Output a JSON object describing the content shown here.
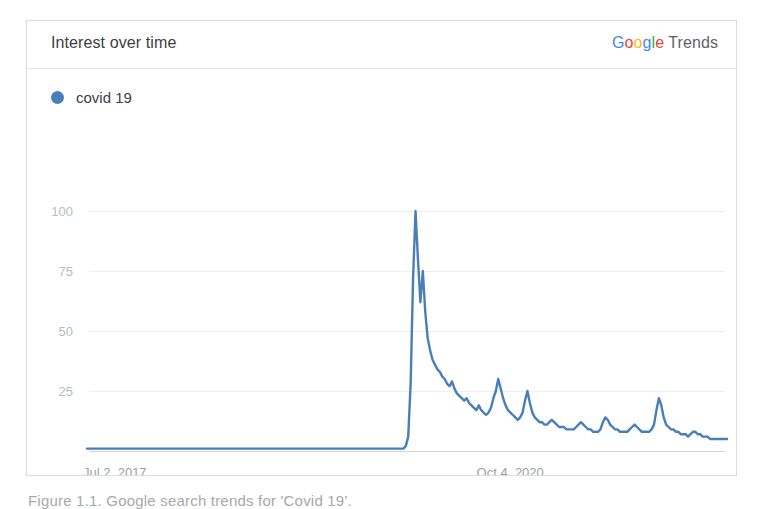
{
  "card": {
    "title": "Interest over time",
    "brand": {
      "google_letters": [
        "G",
        "o",
        "o",
        "g",
        "l",
        "e"
      ],
      "google_colors": [
        "#4285F4",
        "#EA4335",
        "#FBBC05",
        "#4285F4",
        "#34A853",
        "#EA4335"
      ],
      "suffix": "Trends"
    }
  },
  "legend": {
    "items": [
      {
        "label": "covid 19",
        "color": "#4a7ebb"
      }
    ]
  },
  "caption": {
    "text": "Figure 1.1.  Google search trends for 'Covid 19'."
  },
  "chart_data": {
    "type": "line",
    "title": "Interest over time",
    "xlabel": "",
    "ylabel": "",
    "ylim": [
      0,
      100
    ],
    "yticks": [
      25,
      50,
      75,
      100
    ],
    "ytick_labels": [
      "25",
      "50",
      "75",
      "100"
    ],
    "xtick_labels": [
      "Jul 2, 2017",
      "Oct 4, 2020"
    ],
    "xtick_positions": [
      0,
      0.615
    ],
    "grid": true,
    "legend_position": "top-left",
    "x_start": "Jul 2, 2017",
    "x_end": "2022",
    "series": [
      {
        "name": "covid 19",
        "color": "#4a7ebb",
        "values": [
          1,
          1,
          1,
          1,
          1,
          1,
          1,
          1,
          1,
          1,
          1,
          1,
          1,
          1,
          1,
          1,
          1,
          1,
          1,
          1,
          1,
          1,
          1,
          1,
          1,
          1,
          1,
          1,
          1,
          1,
          1,
          1,
          1,
          1,
          1,
          1,
          1,
          1,
          1,
          1,
          1,
          1,
          1,
          1,
          1,
          1,
          1,
          1,
          1,
          1,
          1,
          1,
          1,
          1,
          1,
          1,
          1,
          1,
          1,
          1,
          1,
          1,
          1,
          1,
          1,
          1,
          1,
          1,
          1,
          1,
          1,
          1,
          1,
          1,
          1,
          1,
          1,
          1,
          1,
          1,
          1,
          1,
          1,
          1,
          1,
          1,
          1,
          1,
          1,
          1,
          1,
          1,
          1,
          1,
          1,
          1,
          1,
          1,
          1,
          1,
          1,
          1,
          1,
          1,
          1,
          1,
          1,
          1,
          1,
          1,
          1,
          1,
          1,
          1,
          1,
          1,
          1,
          1,
          1,
          1,
          1,
          1,
          1,
          1,
          1,
          1,
          1,
          1,
          1,
          1,
          1,
          2,
          6,
          28,
          72,
          100,
          80,
          62,
          75,
          58,
          47,
          42,
          38,
          36,
          34,
          33,
          31,
          30,
          28,
          27,
          29,
          26,
          24,
          23,
          22,
          21,
          22,
          20,
          19,
          18,
          17,
          19,
          17,
          16,
          15,
          16,
          18,
          22,
          25,
          30,
          26,
          22,
          19,
          17,
          16,
          15,
          14,
          13,
          14,
          16,
          21,
          25,
          20,
          16,
          14,
          13,
          12,
          12,
          11,
          11,
          12,
          13,
          12,
          11,
          10,
          10,
          10,
          9,
          9,
          9,
          9,
          10,
          11,
          12,
          11,
          10,
          9,
          9,
          8,
          8,
          8,
          9,
          12,
          14,
          13,
          11,
          10,
          9,
          9,
          8,
          8,
          8,
          8,
          9,
          10,
          11,
          10,
          9,
          8,
          8,
          8,
          8,
          9,
          11,
          17,
          22,
          19,
          14,
          11,
          10,
          9,
          9,
          8,
          8,
          7,
          7,
          7,
          6,
          7,
          8,
          8,
          7,
          7,
          6,
          6,
          6,
          5,
          5,
          5,
          5,
          5,
          5,
          5,
          5
        ],
        "peak_value": 100,
        "peak_label": "Mar 2020",
        "baseline_value": 1
      }
    ]
  }
}
